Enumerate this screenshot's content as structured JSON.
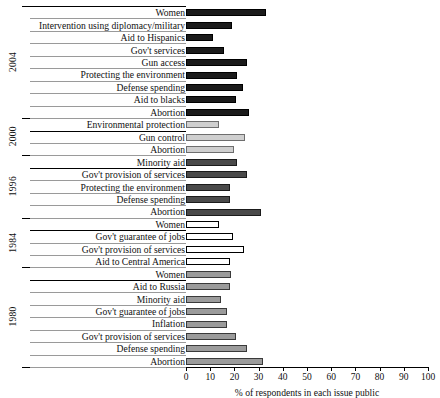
{
  "chart_data": {
    "type": "bar",
    "orientation": "horizontal",
    "title": "",
    "subtitle": "",
    "xlabel": "% of respondents in each issue public",
    "ylabel": "",
    "xlim": [
      0,
      100
    ],
    "xticks": [
      0,
      10,
      20,
      30,
      40,
      50,
      60,
      70,
      80,
      90,
      100
    ],
    "xticklabels": [
      "0",
      "10",
      "20",
      "30",
      "40",
      "50",
      "60",
      "70",
      "80",
      "90",
      "100"
    ],
    "grid": false,
    "legend": "none",
    "group_axis_label": "",
    "groups": [
      {
        "year": "2004",
        "fill": "#1b1b1b",
        "fill_name": "black",
        "categories": [
          "Women",
          "Intervention using diplomacy/military",
          "Aid to Hispanics",
          "Gov't services",
          "Gun access",
          "Protecting the environment",
          "Defense spending",
          "Aid to blacks",
          "Abortion"
        ],
        "values": [
          33,
          19,
          11,
          15.5,
          25,
          21,
          23.5,
          20.5,
          26
        ]
      },
      {
        "year": "2000",
        "fill": "#cfcfcf",
        "fill_name": "light-gray",
        "categories": [
          "Environmental protection",
          "Gun control",
          "Abortion"
        ],
        "values": [
          13.5,
          24.5,
          20
        ]
      },
      {
        "year": "1996",
        "fill": "#4a4a4a",
        "fill_name": "dark-gray",
        "categories": [
          "Minority aid",
          "Gov't provision of services",
          "Protecting the environment",
          "Defense spending",
          "Abortion"
        ],
        "values": [
          21,
          25,
          18,
          18,
          31
        ]
      },
      {
        "year": "1984",
        "fill": "#ffffff",
        "fill_name": "white",
        "categories": [
          "Women",
          "Gov't guarantee of jobs",
          "Gov't provision of services",
          "Aid to Central America"
        ],
        "values": [
          13.5,
          19.5,
          24,
          18
        ]
      },
      {
        "year": "1980",
        "fill": "#9b9b9b",
        "fill_name": "medium-gray",
        "categories": [
          "Women",
          "Aid to Russia",
          "Minority aid",
          "Gov't guarantee of jobs",
          "Inflation",
          "Gov't provision of services",
          "Defense spending",
          "Abortion"
        ],
        "values": [
          18.5,
          18,
          14.5,
          17,
          17,
          20.5,
          25,
          32
        ]
      }
    ]
  }
}
